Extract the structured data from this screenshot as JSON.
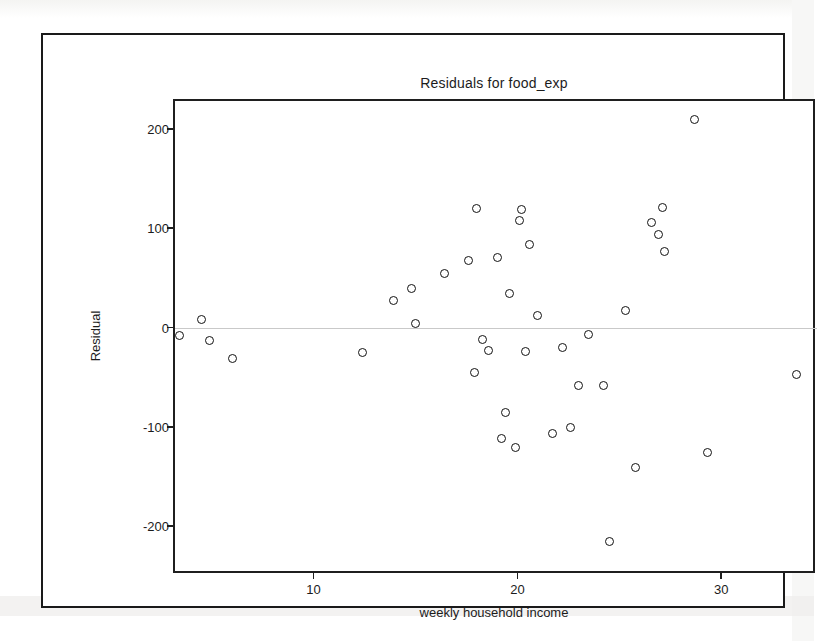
{
  "window": {
    "border_color": "#1a1a1a",
    "background": "#ffffff"
  },
  "chart_data": {
    "type": "scatter",
    "title": "Residuals for food_exp",
    "xlabel": "weekly household income",
    "ylabel": "Residual",
    "xlim": [
      3.2,
      34.5
    ],
    "ylim": [
      -245,
      228
    ],
    "xticks": [
      10,
      20,
      30
    ],
    "xtick_labels": [
      "10",
      "20",
      "30"
    ],
    "yticks": [
      200,
      100,
      0,
      -100,
      -200
    ],
    "ytick_labels": [
      "200",
      "100",
      "0",
      "-100",
      "-200"
    ],
    "grid": false,
    "legend": null,
    "zero_line": 0,
    "zero_line_color": "#c9c9c9",
    "marker": "open-circle",
    "marker_color": "#121212",
    "x": [
      3.4,
      4.5,
      4.9,
      6.0,
      12.4,
      13.9,
      14.8,
      15.0,
      16.4,
      17.6,
      17.9,
      18.0,
      18.3,
      18.6,
      19.0,
      19.2,
      19.4,
      19.6,
      19.9,
      20.1,
      20.2,
      20.4,
      20.6,
      21.0,
      21.7,
      22.2,
      22.6,
      23.0,
      23.5,
      24.2,
      24.5,
      25.3,
      25.8,
      26.6,
      26.9,
      27.1,
      27.2,
      28.7,
      29.3,
      33.7
    ],
    "y": [
      -8,
      8,
      -13,
      -31,
      -25,
      27,
      39,
      4,
      54,
      67,
      -45,
      120,
      -12,
      -23,
      70,
      -112,
      -85,
      34,
      -121,
      108,
      119,
      -24,
      84,
      12,
      -107,
      -20,
      -101,
      -58,
      -7,
      -58,
      -215,
      17,
      -141,
      106,
      94,
      121,
      77,
      209,
      -126,
      -47
    ],
    "n_points": 40
  }
}
